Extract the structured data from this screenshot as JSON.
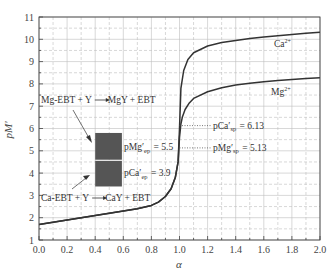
{
  "chart_data": {
    "type": "line",
    "title": "",
    "xlabel": "α",
    "ylabel": "pM'",
    "xlim": [
      0.0,
      2.0
    ],
    "ylim": [
      1,
      11
    ],
    "x_ticks": [
      "0.0",
      "0.2",
      "0.4",
      "0.6",
      "0.8",
      "1.0",
      "1.2",
      "1.4",
      "1.6",
      "1.8",
      "2.0"
    ],
    "y_ticks": [
      "1",
      "2",
      "3",
      "4",
      "5",
      "6",
      "7",
      "8",
      "9",
      "10",
      "11"
    ],
    "grid": true,
    "grid_style": "dashed",
    "series": [
      {
        "name": "Ca2+",
        "label": "Ca",
        "label_sup": "2+",
        "x": [
          0.0,
          0.1,
          0.2,
          0.3,
          0.4,
          0.5,
          0.6,
          0.7,
          0.8,
          0.85,
          0.9,
          0.94,
          0.97,
          0.99,
          1.0,
          1.01,
          1.03,
          1.06,
          1.1,
          1.2,
          1.3,
          1.4,
          1.5,
          1.6,
          1.7,
          1.8,
          1.9,
          2.0
        ],
        "values": [
          1.7,
          1.8,
          1.9,
          2.0,
          2.1,
          2.2,
          2.3,
          2.4,
          2.55,
          2.7,
          2.95,
          3.3,
          3.8,
          4.5,
          6.0,
          7.8,
          8.6,
          9.1,
          9.4,
          9.7,
          9.85,
          9.95,
          10.03,
          10.1,
          10.16,
          10.22,
          10.27,
          10.32
        ]
      },
      {
        "name": "Mg2+",
        "label": "Mg",
        "label_sup": "2+",
        "x": [
          0.0,
          0.1,
          0.2,
          0.3,
          0.4,
          0.5,
          0.6,
          0.7,
          0.8,
          0.85,
          0.9,
          0.94,
          0.97,
          0.99,
          1.0,
          1.01,
          1.02,
          1.04,
          1.07,
          1.1,
          1.2,
          1.3,
          1.4,
          1.5,
          1.6,
          1.7,
          1.8,
          1.9,
          2.0
        ],
        "values": [
          1.7,
          1.8,
          1.9,
          2.0,
          2.1,
          2.2,
          2.3,
          2.4,
          2.55,
          2.7,
          2.95,
          3.3,
          3.8,
          4.5,
          5.6,
          6.2,
          6.5,
          6.85,
          7.15,
          7.35,
          7.65,
          7.83,
          7.95,
          8.03,
          8.1,
          8.15,
          8.2,
          8.24,
          8.28
        ]
      }
    ],
    "annotations": [
      {
        "id": "mg_reaction",
        "text_parts": [
          "Mg-EBT + Y",
          "MgY + EBT"
        ],
        "arrow": "→"
      },
      {
        "id": "ca_reaction",
        "text_parts": [
          "Ca-EBT + Y",
          "CaY + EBT"
        ],
        "arrow": "→"
      },
      {
        "id": "pmg_ep_box",
        "prefix": "pMg",
        "sub": "ep",
        "value": "= 5.5"
      },
      {
        "id": "pca_ep_box",
        "prefix": "pCa",
        "sub": "ep",
        "value": "= 3.9"
      },
      {
        "id": "pca_sp",
        "prefix": "pCa",
        "sub": "sp",
        "value": "= 6.13",
        "y": 6.13
      },
      {
        "id": "pmg_sp",
        "prefix": "pMg",
        "sub": "sp",
        "value": "= 5.13",
        "y": 5.13
      }
    ],
    "indicator_boxes": [
      {
        "label": "Mg-EBT color block",
        "y_range": [
          4.6,
          5.8
        ],
        "x_range": [
          0.4,
          0.59
        ],
        "color": "#555555"
      },
      {
        "label": "Ca-EBT color block",
        "y_range": [
          3.4,
          4.55
        ],
        "x_range": [
          0.4,
          0.59
        ],
        "color": "#555555"
      }
    ],
    "colors": {
      "line": "#333333",
      "grid": "#bdbdbd",
      "axis": "#444444",
      "box": "#555555"
    }
  }
}
